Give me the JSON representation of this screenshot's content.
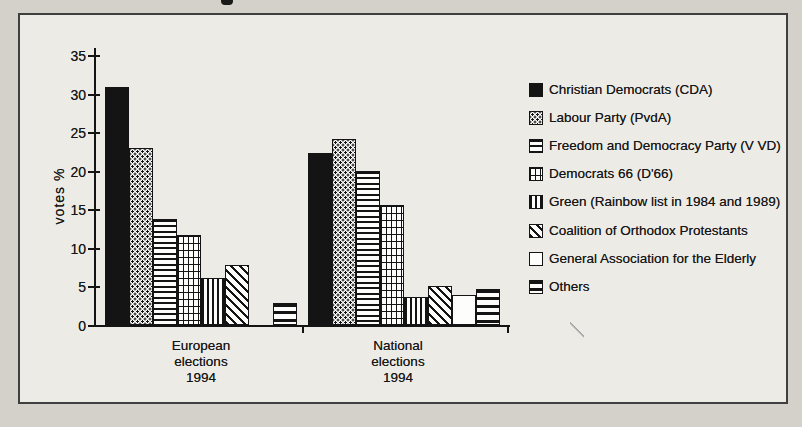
{
  "chart_data": {
    "type": "bar",
    "title": "",
    "xlabel": "",
    "ylabel": "votes %",
    "ylim": [
      0,
      35
    ],
    "y_ticks": [
      35,
      30,
      25,
      20,
      15,
      10,
      5,
      0
    ],
    "grid": false,
    "legend_position": "right",
    "categories": [
      "European elections 1994",
      "National elections 1994"
    ],
    "category_label_lines": [
      [
        "European",
        "elections",
        "1994"
      ],
      [
        "National",
        "elections",
        "1994"
      ]
    ],
    "series": [
      {
        "name": "Christian Democrats (CDA)",
        "pattern_icon": "solid-black-swatch",
        "pattern": "solid",
        "values": [
          30.9,
          22.3
        ]
      },
      {
        "name": "Labour Party (PvdA)",
        "pattern_icon": "dotted-swatch",
        "pattern": "dots",
        "values": [
          22.9,
          24.1
        ]
      },
      {
        "name": "Freedom and Democracy Party (V VD)",
        "pattern_icon": "horizontal-lines-swatch",
        "pattern": "hlines",
        "values": [
          13.7,
          20.0
        ]
      },
      {
        "name": "Democrats 66 (D'66)",
        "pattern_icon": "grid-swatch",
        "pattern": "grid",
        "values": [
          11.7,
          15.5
        ]
      },
      {
        "name": "Green (Rainbow list in 1984 and 1989)",
        "pattern_icon": "vertical-lines-swatch",
        "pattern": "vlines",
        "values": [
          6.1,
          3.6
        ]
      },
      {
        "name": "Coalition of Orthodox Protestants",
        "pattern_icon": "diagonal-lines-swatch",
        "pattern": "diag",
        "values": [
          7.8,
          5.0
        ]
      },
      {
        "name": "General Association for the Elderly",
        "pattern_icon": "white-swatch",
        "pattern": "white",
        "values": [
          0,
          3.9
        ]
      },
      {
        "name": "Others",
        "pattern_icon": "thick-horizontal-lines-swatch",
        "pattern": "thick",
        "values": [
          2.9,
          4.7
        ]
      }
    ],
    "ink_color": "#141414",
    "paper_color": "#edebe6"
  }
}
